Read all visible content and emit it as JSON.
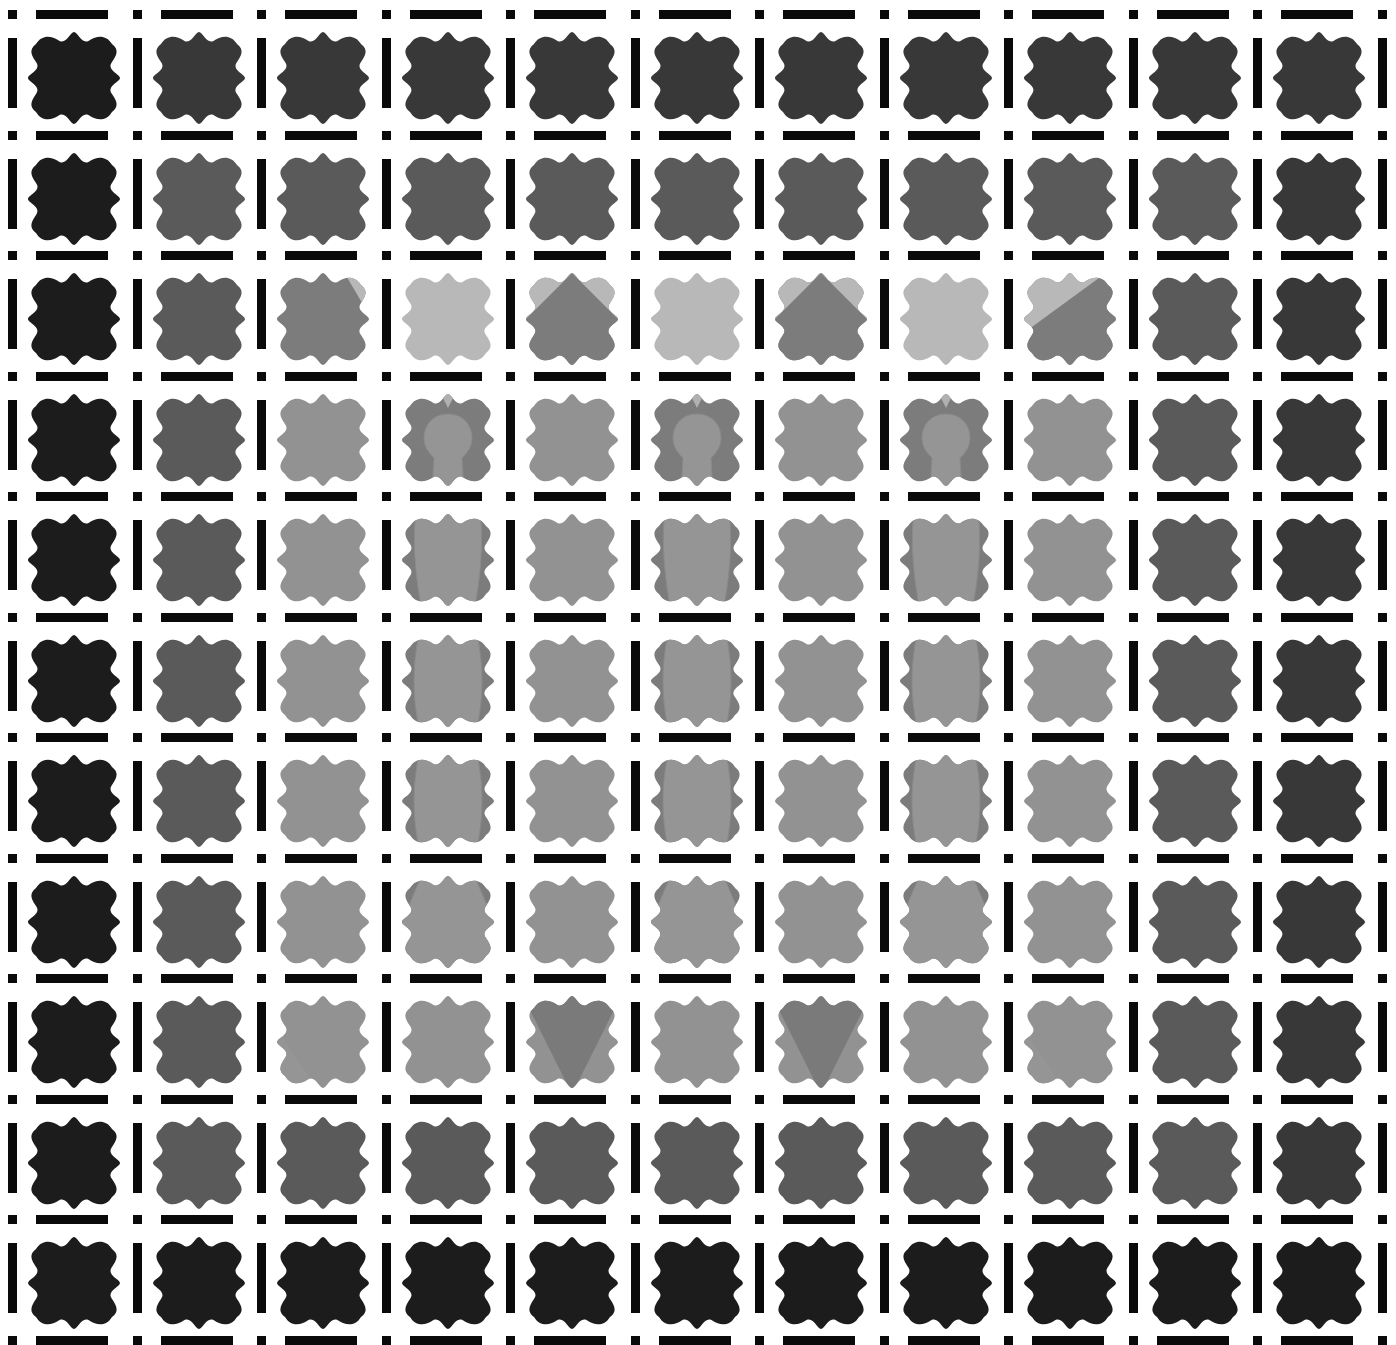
{
  "grid": {
    "rows": 11,
    "cols": 11,
    "origin_x": 22,
    "origin_y": 26,
    "pitch_x": 124.5,
    "pitch_y": 120.5,
    "tile_size": 104
  },
  "palette": {
    "K": "#1c1c1c",
    "D": "#383838",
    "M": "#5a5a5a",
    "G": "#7c7c7c",
    "L": "#929292",
    "P": "#b8b8b8",
    "bar": "#0a0a0a",
    "background": "#ffffff"
  },
  "shades": [
    [
      "K",
      "D",
      "D",
      "D",
      "D",
      "D",
      "D",
      "D",
      "D",
      "D",
      "D"
    ],
    [
      "K",
      "M",
      "M",
      "M",
      "M",
      "M",
      "M",
      "M",
      "M",
      "M",
      "D"
    ],
    [
      "K",
      "M",
      "G",
      "P",
      "G",
      "P",
      "G",
      "P",
      "G",
      "M",
      "D"
    ],
    [
      "K",
      "M",
      "L",
      "G",
      "L",
      "G",
      "L",
      "G",
      "L",
      "M",
      "D"
    ],
    [
      "K",
      "M",
      "L",
      "G",
      "L",
      "G",
      "L",
      "G",
      "L",
      "M",
      "D"
    ],
    [
      "K",
      "M",
      "L",
      "G",
      "L",
      "G",
      "L",
      "G",
      "L",
      "M",
      "D"
    ],
    [
      "K",
      "M",
      "L",
      "G",
      "L",
      "G",
      "L",
      "G",
      "L",
      "M",
      "D"
    ],
    [
      "K",
      "M",
      "L",
      "G",
      "L",
      "G",
      "L",
      "G",
      "L",
      "M",
      "D"
    ],
    [
      "K",
      "M",
      "L",
      "L",
      "L",
      "L",
      "L",
      "L",
      "L",
      "M",
      "D"
    ],
    [
      "K",
      "M",
      "M",
      "M",
      "M",
      "M",
      "M",
      "M",
      "M",
      "M",
      "D"
    ],
    [
      "K",
      "K",
      "K",
      "K",
      "K",
      "K",
      "K",
      "K",
      "K",
      "K",
      "K"
    ]
  ],
  "overlays": [
    {
      "row": 2,
      "col": 2,
      "type": "roof-right"
    },
    {
      "row": 2,
      "col": 4,
      "type": "roof"
    },
    {
      "row": 2,
      "col": 6,
      "type": "roof"
    },
    {
      "row": 2,
      "col": 8,
      "type": "roof-left"
    },
    {
      "row": 3,
      "col": 3,
      "type": "head"
    },
    {
      "row": 3,
      "col": 5,
      "type": "head"
    },
    {
      "row": 3,
      "col": 7,
      "type": "head"
    },
    {
      "row": 4,
      "col": 3,
      "type": "torso-narrow"
    },
    {
      "row": 4,
      "col": 5,
      "type": "torso-narrow"
    },
    {
      "row": 4,
      "col": 7,
      "type": "torso-narrow"
    },
    {
      "row": 5,
      "col": 3,
      "type": "torso-wide"
    },
    {
      "row": 5,
      "col": 5,
      "type": "torso-wide"
    },
    {
      "row": 5,
      "col": 7,
      "type": "torso-wide"
    },
    {
      "row": 6,
      "col": 3,
      "type": "torso-wide"
    },
    {
      "row": 6,
      "col": 5,
      "type": "torso-wide"
    },
    {
      "row": 6,
      "col": 7,
      "type": "torso-wide"
    },
    {
      "row": 7,
      "col": 3,
      "type": "skirt"
    },
    {
      "row": 7,
      "col": 5,
      "type": "skirt"
    },
    {
      "row": 7,
      "col": 7,
      "type": "skirt"
    },
    {
      "row": 8,
      "col": 2,
      "type": "wedge-left"
    },
    {
      "row": 8,
      "col": 4,
      "type": "v-down"
    },
    {
      "row": 8,
      "col": 6,
      "type": "v-down"
    },
    {
      "row": 8,
      "col": 8,
      "type": "wedge-left"
    }
  ],
  "overlay_colors": {
    "roof": "#7c7c7c",
    "roof_bg": "#b8b8b8",
    "figure": "#959595",
    "figure_edge": "#8a8a8a",
    "neck": "#b0b0b0",
    "v_dark": "#7a7a7a"
  }
}
